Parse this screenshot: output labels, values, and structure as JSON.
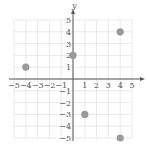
{
  "chart_data": {
    "type": "scatter",
    "title": "",
    "xlabel": "x",
    "ylabel": "y",
    "xlim": [
      -5,
      5
    ],
    "ylim": [
      -5,
      5
    ],
    "grid": true,
    "x_ticks": [
      -5,
      -4,
      -3,
      -2,
      -1,
      1,
      2,
      3,
      4,
      5
    ],
    "y_ticks": [
      -5,
      -4,
      -3,
      -2,
      -1,
      1,
      2,
      3,
      4,
      5
    ],
    "x_tick_labels": [
      "−5",
      "−4",
      "−3",
      "−2",
      "−1",
      "1",
      "2",
      "3",
      "4",
      "5"
    ],
    "y_tick_labels": [
      "−5",
      "−4",
      "−3",
      "−2",
      "−1",
      "1",
      "2",
      "3",
      "4",
      "5"
    ],
    "series": [
      {
        "name": "points",
        "color": "#9a9a9a",
        "points": [
          {
            "x": -4,
            "y": 1
          },
          {
            "x": 0,
            "y": 2
          },
          {
            "x": 4,
            "y": 4
          },
          {
            "x": 1,
            "y": -3
          },
          {
            "x": 4,
            "y": -5
          }
        ]
      }
    ]
  }
}
